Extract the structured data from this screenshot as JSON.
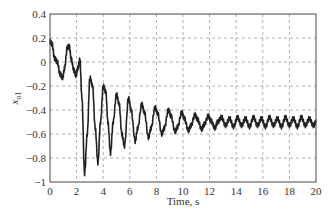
{
  "chart_data": {
    "type": "line",
    "title": "",
    "xlabel": "Time, s",
    "ylabel": "x",
    "ylabel_sub": "o1",
    "xlim": [
      0,
      20
    ],
    "ylim": [
      -1,
      0.4
    ],
    "xticks": [
      0,
      2,
      4,
      6,
      8,
      10,
      12,
      14,
      16,
      18,
      20
    ],
    "yticks": [
      0.4,
      0.2,
      0,
      -0.2,
      -0.4,
      -0.6,
      -0.8,
      -1
    ],
    "ytick_labels": [
      "0.4",
      "0.2",
      "0",
      "−0.2",
      "−0.4",
      "−0.6",
      "−0.8",
      "−1"
    ],
    "grid": true,
    "grid_style": "dashed",
    "legend": null,
    "series": [
      {
        "name": "x_o1",
        "color": "#222222",
        "x": [
          0,
          0.15,
          0.35,
          0.55,
          0.75,
          0.95,
          1.1,
          1.3,
          1.45,
          1.6,
          1.8,
          1.95,
          2.1,
          2.25,
          2.4,
          2.6,
          2.8,
          3.0,
          3.2,
          3.4,
          3.6,
          3.8,
          4.0,
          4.2,
          4.35,
          4.55,
          4.75,
          5.0,
          5.2,
          5.4,
          5.6,
          5.9,
          6.1,
          6.4,
          6.6,
          6.9,
          7.1,
          7.4,
          7.6,
          7.9,
          8.1,
          8.4,
          8.6,
          8.9,
          9.1,
          9.4,
          9.6,
          9.9,
          10.1,
          10.4,
          10.6,
          10.9,
          11.1,
          11.4,
          11.6,
          11.9,
          12.1,
          12.4,
          12.6,
          12.9,
          13.2,
          13.5,
          13.8,
          14.1,
          14.4,
          14.7,
          15.0,
          15.3,
          15.6,
          15.9,
          16.2,
          16.5,
          16.8,
          17.1,
          17.4,
          17.7,
          18.0,
          18.3,
          18.6,
          18.9,
          19.2,
          19.5,
          19.8,
          20.0
        ],
        "values": [
          0.17,
          0.15,
          0.03,
          0.0,
          -0.1,
          -0.13,
          -0.05,
          0.12,
          0.13,
          0.02,
          -0.07,
          -0.11,
          -0.05,
          0.02,
          -0.3,
          -0.93,
          -0.6,
          -0.13,
          -0.2,
          -0.55,
          -0.84,
          -0.5,
          -0.2,
          -0.25,
          -0.5,
          -0.76,
          -0.5,
          -0.27,
          -0.35,
          -0.6,
          -0.7,
          -0.3,
          -0.4,
          -0.66,
          -0.55,
          -0.35,
          -0.42,
          -0.63,
          -0.55,
          -0.38,
          -0.43,
          -0.6,
          -0.55,
          -0.4,
          -0.45,
          -0.58,
          -0.54,
          -0.42,
          -0.47,
          -0.57,
          -0.53,
          -0.44,
          -0.48,
          -0.56,
          -0.52,
          -0.45,
          -0.49,
          -0.55,
          -0.5,
          -0.46,
          -0.53,
          -0.47,
          -0.54,
          -0.46,
          -0.53,
          -0.47,
          -0.54,
          -0.46,
          -0.53,
          -0.47,
          -0.54,
          -0.46,
          -0.53,
          -0.47,
          -0.54,
          -0.46,
          -0.53,
          -0.47,
          -0.54,
          -0.46,
          -0.53,
          -0.47,
          -0.53,
          -0.5
        ]
      }
    ]
  }
}
